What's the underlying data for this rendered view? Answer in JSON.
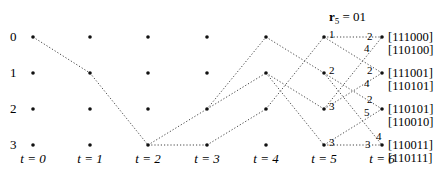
{
  "diagram": {
    "type": "trellis",
    "header": {
      "symbol": "r",
      "subscript": "5",
      "rest": " = 01"
    },
    "state_labels": [
      "0",
      "1",
      "2",
      "3"
    ],
    "time_labels": [
      "t = 0",
      "t = 1",
      "t = 2",
      "t = 3",
      "t = 4",
      "t = 5",
      "t = 6"
    ],
    "layout": {
      "columns_x": [
        33,
        90,
        148,
        207,
        266,
        324,
        382
      ],
      "rows_y": [
        37,
        73,
        109,
        145
      ],
      "state_label_x": 10,
      "time_label_y": 163,
      "dot_color": "#111111",
      "edge_color": "#444444"
    },
    "edges": [
      {
        "from": [
          0,
          0
        ],
        "to": [
          1,
          1
        ]
      },
      {
        "from": [
          1,
          1
        ],
        "to": [
          2,
          3
        ]
      },
      {
        "from": [
          2,
          3
        ],
        "to": [
          3,
          2
        ]
      },
      {
        "from": [
          2,
          3
        ],
        "to": [
          3,
          3
        ]
      },
      {
        "from": [
          3,
          2
        ],
        "to": [
          4,
          0
        ]
      },
      {
        "from": [
          3,
          2
        ],
        "to": [
          4,
          1
        ]
      },
      {
        "from": [
          3,
          3
        ],
        "to": [
          4,
          2
        ]
      },
      {
        "from": [
          4,
          0
        ],
        "to": [
          5,
          1
        ]
      },
      {
        "from": [
          4,
          1
        ],
        "to": [
          5,
          2
        ]
      },
      {
        "from": [
          4,
          1
        ],
        "to": [
          5,
          3
        ]
      },
      {
        "from": [
          4,
          2
        ],
        "to": [
          5,
          0
        ]
      },
      {
        "from": [
          5,
          0
        ],
        "to": [
          6,
          0
        ]
      },
      {
        "from": [
          5,
          0
        ],
        "to": [
          6,
          1
        ]
      },
      {
        "from": [
          5,
          1
        ],
        "to": [
          6,
          2
        ]
      },
      {
        "from": [
          5,
          1
        ],
        "to": [
          6,
          3
        ]
      },
      {
        "from": [
          5,
          2
        ],
        "to": [
          6,
          0
        ]
      },
      {
        "from": [
          5,
          2
        ],
        "to": [
          6,
          1
        ]
      },
      {
        "from": [
          5,
          3
        ],
        "to": [
          6,
          2
        ]
      },
      {
        "from": [
          5,
          3
        ],
        "to": [
          6,
          3
        ]
      }
    ],
    "t5_metrics": [
      "1",
      "2",
      "3",
      "3"
    ],
    "t6_edge_labels": [
      {
        "text": "2",
        "x": 367,
        "y": 40
      },
      {
        "text": "4",
        "x": 364,
        "y": 52
      },
      {
        "text": "2",
        "x": 367,
        "y": 74
      },
      {
        "text": "4",
        "x": 364,
        "y": 87
      },
      {
        "text": "2",
        "x": 367,
        "y": 103
      },
      {
        "text": "5",
        "x": 364,
        "y": 116
      },
      {
        "text": "4",
        "x": 376,
        "y": 140
      },
      {
        "text": "3",
        "x": 365,
        "y": 148
      }
    ],
    "codewords": [
      [
        "[111000]",
        "[110100]"
      ],
      [
        "[111001]",
        "[110101]"
      ],
      [
        "[110101]",
        "[110010]"
      ],
      [
        "[110011]",
        "[110111]"
      ]
    ]
  }
}
